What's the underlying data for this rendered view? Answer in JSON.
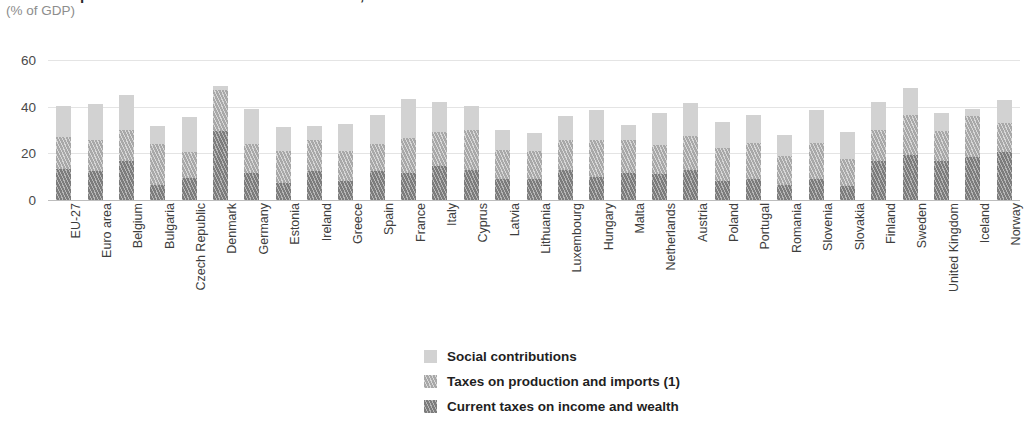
{
  "header": {
    "title": "Total receipts from taxes and social contributions, 2007",
    "subtitle": "(% of GDP)"
  },
  "legend": {
    "items": [
      {
        "label": "Social contributions",
        "key": "social",
        "color": "#d2d2d2",
        "swatch": "solid-light-gray-swatch"
      },
      {
        "label": "Taxes on production and imports (1)",
        "key": "production",
        "color": "#a8a8a8",
        "swatch": "hatched-mid-gray-swatch"
      },
      {
        "label": "Current taxes on income and wealth",
        "key": "income",
        "color": "#7c7c7c",
        "swatch": "hatched-dark-gray-swatch"
      }
    ]
  },
  "chart_data": {
    "type": "bar",
    "subtype": "stacked-vertical",
    "title": "Total receipts from taxes and social contributions, 2007",
    "subtitle": "(% of GDP)",
    "xlabel": "",
    "ylabel": "(% of GDP)",
    "ylim": [
      0,
      60
    ],
    "yticks": [
      0,
      20,
      40,
      60
    ],
    "grid": true,
    "grid_axis": "y",
    "legend_position": "bottom-center",
    "footnote_marker": "(1)",
    "categories": [
      "EU-27",
      "Euro area",
      "Belgium",
      "Bulgaria",
      "Czech Republic",
      "Denmark",
      "Germany",
      "Estonia",
      "Ireland",
      "Greece",
      "Spain",
      "France",
      "Italy",
      "Cyprus",
      "Latvia",
      "Lithuania",
      "Luxembourg",
      "Hungary",
      "Malta",
      "Netherlands",
      "Austria",
      "Poland",
      "Portugal",
      "Romania",
      "Slovenia",
      "Slovakia",
      "Finland",
      "Sweden",
      "United Kingdom",
      "Iceland",
      "Norway"
    ],
    "series": [
      {
        "name": "Current taxes on income and wealth",
        "key": "income",
        "color": "#7c7c7c",
        "values": [
          13.3,
          12.5,
          16.9,
          6.3,
          9.3,
          29.4,
          11.5,
          7.3,
          12.6,
          8.1,
          12.4,
          11.5,
          14.6,
          13.0,
          9.1,
          9.0,
          13.0,
          9.8,
          11.7,
          11.3,
          12.8,
          8.1,
          9.1,
          6.5,
          8.9,
          6.1,
          16.9,
          19.1,
          16.6,
          18.3,
          20.5
        ]
      },
      {
        "name": "Taxes on production and imports (1)",
        "key": "production",
        "color": "#a8a8a8",
        "values": [
          13.6,
          13.4,
          13.1,
          17.5,
          11.2,
          17.6,
          12.3,
          13.5,
          13.3,
          12.9,
          11.6,
          15.2,
          14.6,
          17.0,
          12.2,
          11.9,
          12.9,
          15.9,
          14.1,
          12.2,
          14.8,
          14.2,
          15.2,
          12.4,
          15.7,
          11.4,
          13.1,
          17.4,
          12.9,
          17.5,
          12.7
        ]
      },
      {
        "name": "Social contributions",
        "key": "social",
        "color": "#d2d2d2",
        "values": [
          13.2,
          15.3,
          14.9,
          8.0,
          15.0,
          1.7,
          15.3,
          10.7,
          5.7,
          11.5,
          12.3,
          16.5,
          13.0,
          10.4,
          8.6,
          7.8,
          10.1,
          12.8,
          6.5,
          14.0,
          14.0,
          11.0,
          12.0,
          9.1,
          14.1,
          11.7,
          12.1,
          11.5,
          8.0,
          3.1,
          9.6
        ]
      }
    ],
    "totals": [
      40.1,
      41.2,
      44.9,
      31.8,
      35.5,
      48.7,
      39.1,
      31.5,
      31.6,
      32.5,
      36.3,
      43.2,
      42.2,
      40.4,
      29.9,
      28.7,
      36.0,
      38.5,
      32.3,
      37.5,
      41.6,
      33.3,
      36.3,
      28.0,
      38.7,
      29.2,
      42.1,
      48.0,
      37.5,
      38.9,
      42.8
    ]
  }
}
